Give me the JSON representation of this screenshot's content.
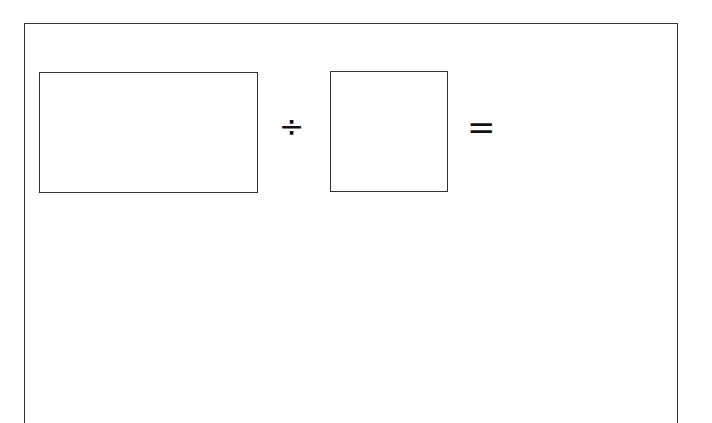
{
  "worksheet": {
    "dividend_box": {
      "value": ""
    },
    "divide_symbol": "÷",
    "divisor_box": {
      "value": ""
    },
    "equals_symbol": "=",
    "answer": ""
  }
}
